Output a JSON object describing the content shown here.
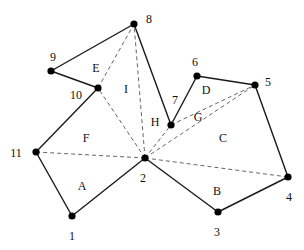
{
  "diagram": {
    "nodes": [
      {
        "id": "1",
        "x": 72,
        "y": 216,
        "lx": 72,
        "ly": 240
      },
      {
        "id": "2",
        "x": 145,
        "y": 158,
        "lx": 143,
        "ly": 182
      },
      {
        "id": "3",
        "x": 218,
        "y": 212,
        "lx": 217,
        "ly": 236
      },
      {
        "id": "4",
        "x": 288,
        "y": 177,
        "lx": 289,
        "ly": 201
      },
      {
        "id": "5",
        "x": 255,
        "y": 85,
        "lx": 268,
        "ly": 86
      },
      {
        "id": "6",
        "x": 197,
        "y": 76,
        "lx": 195,
        "ly": 66
      },
      {
        "id": "7",
        "x": 171,
        "y": 125,
        "lx": 175,
        "ly": 104
      },
      {
        "id": "8",
        "x": 134,
        "y": 24,
        "lx": 149,
        "ly": 23
      },
      {
        "id": "9",
        "x": 51,
        "y": 71,
        "lx": 53,
        "ly": 61
      },
      {
        "id": "10",
        "x": 98,
        "y": 88,
        "lx": 76,
        "ly": 99
      },
      {
        "id": "11",
        "x": 36,
        "y": 152,
        "lx": 16,
        "ly": 157
      }
    ],
    "solid_edges": [
      [
        "11",
        "1"
      ],
      [
        "1",
        "2"
      ],
      [
        "2",
        "3"
      ],
      [
        "3",
        "4"
      ],
      [
        "4",
        "5"
      ],
      [
        "5",
        "6"
      ],
      [
        "6",
        "7"
      ],
      [
        "7",
        "8"
      ],
      [
        "8",
        "9"
      ],
      [
        "9",
        "10"
      ],
      [
        "10",
        "11"
      ]
    ],
    "dashed_edges": [
      [
        "2",
        "11"
      ],
      [
        "2",
        "10"
      ],
      [
        "2",
        "8"
      ],
      [
        "2",
        "7"
      ],
      [
        "2",
        "5"
      ],
      [
        "2",
        "4"
      ],
      [
        "10",
        "8"
      ],
      [
        "7",
        "5"
      ]
    ],
    "regions": [
      {
        "label": "A",
        "x": 82,
        "y": 190
      },
      {
        "label": "B",
        "x": 217,
        "y": 195
      },
      {
        "label": "C",
        "x": 223,
        "y": 142
      },
      {
        "label": "D",
        "x": 206,
        "y": 94
      },
      {
        "label": "E",
        "x": 96,
        "y": 72
      },
      {
        "label": "F",
        "x": 86,
        "y": 142
      },
      {
        "label": "G",
        "x": 198,
        "y": 121
      },
      {
        "label": "H",
        "x": 155,
        "y": 126
      },
      {
        "label": "I",
        "x": 126,
        "y": 93
      }
    ]
  }
}
